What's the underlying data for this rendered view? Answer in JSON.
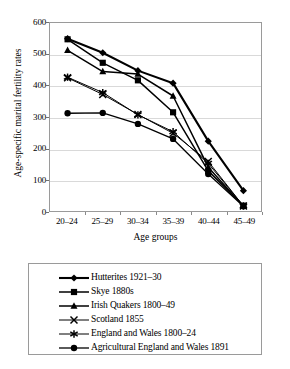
{
  "chart_data": {
    "type": "line",
    "title": "",
    "xlabel": "Age groups",
    "ylabel": "Age-specific marital fertility rates",
    "categories": [
      "20–24",
      "25–29",
      "30–34",
      "35–39",
      "40–44",
      "45–49"
    ],
    "ylim": [
      0,
      600
    ],
    "yticks": [
      0,
      100,
      200,
      300,
      400,
      500,
      600
    ],
    "ytick_labels": [
      "0",
      "100",
      "200",
      "300",
      "400",
      "500",
      "600"
    ],
    "grid": "horizontal",
    "legend_position": "below-plot-boxed",
    "series": [
      {
        "name": "Hutterites 1921–30",
        "marker": "diamond",
        "color": "#000000",
        "line_width": 2.1,
        "values": [
          550,
          505,
          448,
          408,
          223,
          65
        ]
      },
      {
        "name": "Skye 1880s",
        "marker": "square",
        "color": "#000000",
        "line_width": 1.5,
        "values": [
          548,
          473,
          417,
          315,
          128,
          17
        ]
      },
      {
        "name": "Irish Quakers 1800–49",
        "marker": "triangle",
        "color": "#000000",
        "line_width": 1.5,
        "values": [
          513,
          445,
          437,
          367,
          140,
          15
        ]
      },
      {
        "name": "Scotland 1855",
        "marker": "x",
        "color": "#000000",
        "line_width": 1.0,
        "values": [
          425,
          372,
          308,
          248,
          158,
          16
        ]
      },
      {
        "name": "England and Wales 1800–24",
        "marker": "asterisk",
        "color": "#000000",
        "line_width": 1.0,
        "values": [
          427,
          378,
          307,
          253,
          152,
          16
        ]
      },
      {
        "name": "Agricultural England and Wales 1891",
        "marker": "circle",
        "color": "#000000",
        "line_width": 1.3,
        "values": [
          312,
          313,
          278,
          230,
          118,
          15
        ]
      }
    ]
  }
}
